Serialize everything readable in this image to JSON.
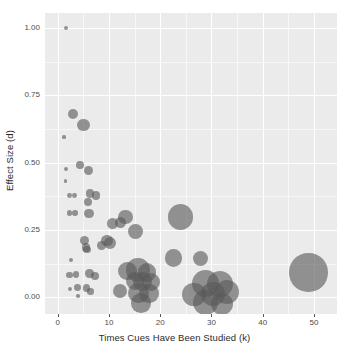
{
  "chart_data": {
    "type": "scatter",
    "title": "",
    "subtitle": "",
    "xlabel": "Times Cues Have Been Studied (k)",
    "ylabel": "Effect Size (d)",
    "xlim": [
      -2.5,
      54.5
    ],
    "ylim": [
      -0.062,
      1.055
    ],
    "xticks": [
      0,
      10,
      20,
      30,
      40,
      50
    ],
    "xtick_labels": [
      "0",
      "10",
      "20",
      "30",
      "40",
      "50"
    ],
    "yticks": [
      0.0,
      0.25,
      0.5,
      0.75,
      1.0
    ],
    "ytick_labels": [
      "0.00",
      "0.25",
      "0.50",
      "0.75",
      "1.00"
    ],
    "grid": true,
    "legend": "none",
    "point_color": "#595959",
    "point_opacity": 0.62,
    "panel_background": "#ebebeb",
    "grid_color": "#ffffff",
    "size_encoding": "bubble area proportional to study weight / sample size",
    "points": [
      {
        "x": 1.6,
        "y": 1.0,
        "size": 2.2
      },
      {
        "x": 2.9,
        "y": 0.68,
        "size": 5.0
      },
      {
        "x": 5.0,
        "y": 0.64,
        "size": 6.2
      },
      {
        "x": 1.2,
        "y": 0.595,
        "size": 1.6
      },
      {
        "x": 4.3,
        "y": 0.49,
        "size": 3.8
      },
      {
        "x": 1.6,
        "y": 0.475,
        "size": 2.2
      },
      {
        "x": 6.0,
        "y": 0.47,
        "size": 4.6
      },
      {
        "x": 1.5,
        "y": 0.432,
        "size": 1.8
      },
      {
        "x": 2.3,
        "y": 0.378,
        "size": 2.4
      },
      {
        "x": 3.3,
        "y": 0.378,
        "size": 2.4
      },
      {
        "x": 6.3,
        "y": 0.385,
        "size": 4.2
      },
      {
        "x": 7.5,
        "y": 0.378,
        "size": 4.2
      },
      {
        "x": 5.9,
        "y": 0.352,
        "size": 4.0
      },
      {
        "x": 2.3,
        "y": 0.312,
        "size": 2.8
      },
      {
        "x": 3.4,
        "y": 0.312,
        "size": 2.8
      },
      {
        "x": 6.1,
        "y": 0.312,
        "size": 4.6
      },
      {
        "x": 13.2,
        "y": 0.298,
        "size": 7.2
      },
      {
        "x": 24.0,
        "y": 0.298,
        "size": 12.6
      },
      {
        "x": 10.6,
        "y": 0.275,
        "size": 5.6
      },
      {
        "x": 12.2,
        "y": 0.278,
        "size": 5.6
      },
      {
        "x": 15.2,
        "y": 0.243,
        "size": 7.4
      },
      {
        "x": 5.2,
        "y": 0.212,
        "size": 4.6
      },
      {
        "x": 9.6,
        "y": 0.212,
        "size": 5.6
      },
      {
        "x": 10.2,
        "y": 0.202,
        "size": 6.0
      },
      {
        "x": 5.5,
        "y": 0.185,
        "size": 4.2
      },
      {
        "x": 8.6,
        "y": 0.192,
        "size": 4.4
      },
      {
        "x": 5.7,
        "y": 0.178,
        "size": 3.6
      },
      {
        "x": 2.6,
        "y": 0.138,
        "size": 2.0
      },
      {
        "x": 22.6,
        "y": 0.146,
        "size": 8.6
      },
      {
        "x": 27.8,
        "y": 0.145,
        "size": 7.6
      },
      {
        "x": 48.9,
        "y": 0.092,
        "size": 19.2
      },
      {
        "x": 13.6,
        "y": 0.098,
        "size": 9.2
      },
      {
        "x": 15.6,
        "y": 0.102,
        "size": 11.8
      },
      {
        "x": 17.4,
        "y": 0.092,
        "size": 9.4
      },
      {
        "x": 2.3,
        "y": 0.082,
        "size": 3.2
      },
      {
        "x": 3.5,
        "y": 0.084,
        "size": 3.2
      },
      {
        "x": 6.2,
        "y": 0.088,
        "size": 4.2
      },
      {
        "x": 7.3,
        "y": 0.078,
        "size": 3.8
      },
      {
        "x": 15.0,
        "y": 0.062,
        "size": 9.0
      },
      {
        "x": 16.6,
        "y": 0.058,
        "size": 9.6
      },
      {
        "x": 18.2,
        "y": 0.055,
        "size": 9.0
      },
      {
        "x": 28.8,
        "y": 0.052,
        "size": 13.4
      },
      {
        "x": 31.6,
        "y": 0.048,
        "size": 13.0
      },
      {
        "x": 2.4,
        "y": 0.032,
        "size": 2.0
      },
      {
        "x": 3.9,
        "y": 0.036,
        "size": 3.4
      },
      {
        "x": 5.6,
        "y": 0.034,
        "size": 3.8
      },
      {
        "x": 6.4,
        "y": 0.022,
        "size": 3.2
      },
      {
        "x": 12.2,
        "y": 0.022,
        "size": 7.0
      },
      {
        "x": 15.8,
        "y": 0.016,
        "size": 10.4
      },
      {
        "x": 17.8,
        "y": 0.014,
        "size": 9.6
      },
      {
        "x": 26.6,
        "y": 0.01,
        "size": 11.6
      },
      {
        "x": 30.2,
        "y": 0.012,
        "size": 12.0
      },
      {
        "x": 33.0,
        "y": 0.018,
        "size": 12.0
      },
      {
        "x": 3.9,
        "y": 0.004,
        "size": 1.8
      },
      {
        "x": 16.2,
        "y": -0.022,
        "size": 9.8
      },
      {
        "x": 28.8,
        "y": -0.02,
        "size": 12.4
      },
      {
        "x": 32.0,
        "y": -0.024,
        "size": 11.0
      }
    ]
  }
}
